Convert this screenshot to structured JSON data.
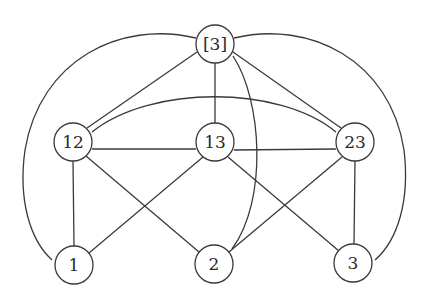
{
  "diagram": {
    "type": "graph",
    "colors": {
      "stroke": "#3a3a3a",
      "background": "#ffffff",
      "text": "#2a2a2a"
    },
    "nodes": [
      {
        "id": "n3b",
        "label": "[3]",
        "x": 215,
        "y": 44
      },
      {
        "id": "n12",
        "label": "12",
        "x": 73,
        "y": 142
      },
      {
        "id": "n13",
        "label": "13",
        "x": 215,
        "y": 142
      },
      {
        "id": "n23",
        "label": "23",
        "x": 355,
        "y": 142
      },
      {
        "id": "n1",
        "label": "1",
        "x": 74,
        "y": 265
      },
      {
        "id": "n2",
        "label": "2",
        "x": 214,
        "y": 264
      },
      {
        "id": "n3",
        "label": "3",
        "x": 353,
        "y": 263
      }
    ],
    "node_radius": 19,
    "edges": [
      {
        "from": "[3]",
        "to": "12",
        "kind": "straight"
      },
      {
        "from": "[3]",
        "to": "13",
        "kind": "straight"
      },
      {
        "from": "[3]",
        "to": "23",
        "kind": "straight"
      },
      {
        "from": "12",
        "to": "13",
        "kind": "straight"
      },
      {
        "from": "13",
        "to": "23",
        "kind": "straight"
      },
      {
        "from": "12",
        "to": "1",
        "kind": "straight"
      },
      {
        "from": "12",
        "to": "2",
        "kind": "straight"
      },
      {
        "from": "13",
        "to": "1",
        "kind": "straight"
      },
      {
        "from": "13",
        "to": "3",
        "kind": "straight"
      },
      {
        "from": "23",
        "to": "2",
        "kind": "straight"
      },
      {
        "from": "23",
        "to": "3",
        "kind": "straight"
      },
      {
        "from": "[3]",
        "to": "1",
        "kind": "curved-outer-left"
      },
      {
        "from": "[3]",
        "to": "3",
        "kind": "curved-outer-right"
      },
      {
        "from": "12",
        "to": "23",
        "kind": "curved-arc-over-13"
      },
      {
        "from": "[3]",
        "to": "2",
        "kind": "curved-bulge-right"
      }
    ]
  }
}
